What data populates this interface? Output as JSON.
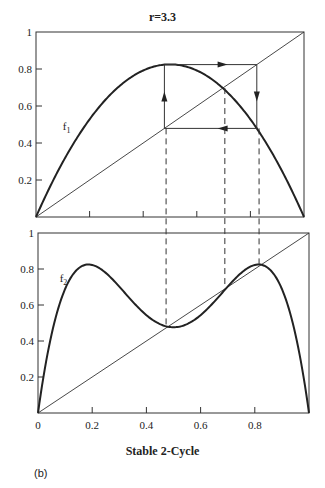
{
  "figure": {
    "title": "r=3.3",
    "xlabel": "Stable 2-Cycle",
    "panel_label": "(b)"
  },
  "chart_data": [
    {
      "type": "line",
      "title": "r=3.3",
      "curve_label": "f1",
      "function": "f1(x) = 3.3 x (1 - x)",
      "xlim": [
        0,
        1
      ],
      "ylim": [
        0,
        1
      ],
      "yticks": [
        "0.2",
        "0.4",
        "0.6",
        "0.8",
        "1"
      ],
      "xticks_unlabeled": [
        0.2,
        0.4,
        0.6,
        0.8
      ],
      "grid": false,
      "series": [
        {
          "name": "f1",
          "x": [
            0,
            0.1,
            0.2,
            0.3,
            0.4,
            0.5,
            0.6,
            0.7,
            0.8,
            0.9,
            1.0
          ],
          "values": [
            0,
            0.297,
            0.528,
            0.693,
            0.792,
            0.825,
            0.792,
            0.693,
            0.528,
            0.297,
            0
          ]
        },
        {
          "name": "y=x",
          "x": [
            0,
            1
          ],
          "values": [
            0,
            1
          ]
        }
      ],
      "cobweb": {
        "cycle_points": [
          0.479,
          0.824
        ],
        "fixed_point": 0.697,
        "path": [
          [
            0.479,
            0.479
          ],
          [
            0.479,
            0.824
          ],
          [
            0.824,
            0.824
          ],
          [
            0.824,
            0.479
          ],
          [
            0.479,
            0.479
          ]
        ]
      }
    },
    {
      "type": "line",
      "curve_label": "f2",
      "function": "f2(x) = f1(f1(x))",
      "xlabel": "Stable 2-Cycle",
      "xlim": [
        0,
        1
      ],
      "ylim": [
        0,
        1
      ],
      "xticks": [
        "0",
        "0.2",
        "0.4",
        "0.6",
        "0.8"
      ],
      "yticks": [
        "0.2",
        "0.4",
        "0.6",
        "0.8",
        "1"
      ],
      "grid": false,
      "series": [
        {
          "name": "f2",
          "x": [
            0,
            0.05,
            0.1,
            0.17,
            0.25,
            0.35,
            0.479,
            0.55,
            0.697,
            0.824,
            0.9,
            0.95,
            1.0
          ],
          "values": [
            0,
            0.49,
            0.726,
            0.822,
            0.787,
            0.655,
            0.479,
            0.497,
            0.697,
            0.824,
            0.726,
            0.49,
            0
          ]
        },
        {
          "name": "y=x",
          "x": [
            0,
            1
          ],
          "values": [
            0,
            1
          ]
        }
      ],
      "fixed_points_marked": [
        0.479,
        0.697,
        0.824
      ]
    }
  ]
}
